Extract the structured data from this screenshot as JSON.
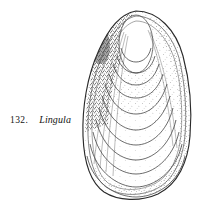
{
  "page": {
    "background_color": "#ffffff",
    "ink_color": "#1a1a1a"
  },
  "caption": {
    "number": "132.",
    "name": "Lingula"
  },
  "figure": {
    "rendering_style": "stippled-line-drawing",
    "orientation": "apex-up",
    "growth_line_count": 12,
    "outline_color": "#2a2a2a",
    "stipple_color": "#333333"
  }
}
